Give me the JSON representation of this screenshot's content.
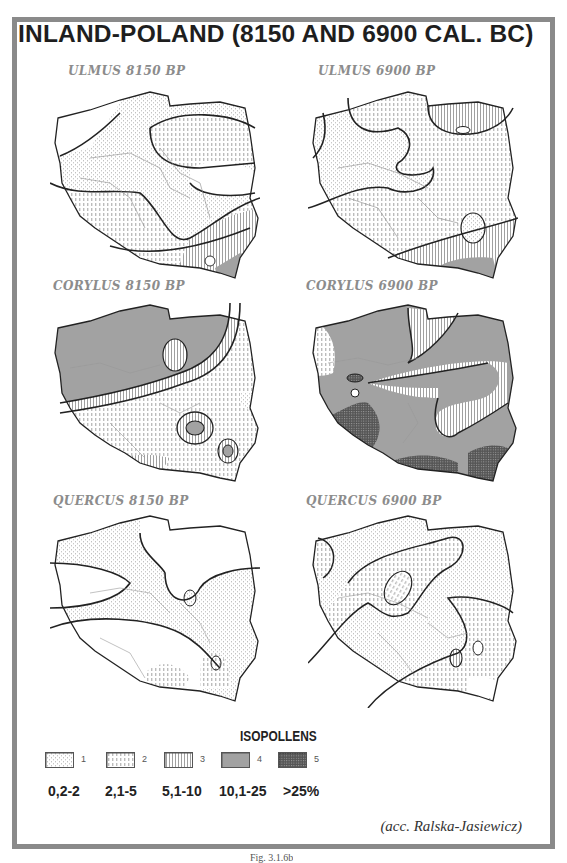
{
  "title": "INLAND-POLAND (8150 AND 6900 CAL. BC)",
  "maps": [
    {
      "label": "ULMUS 8150 BP",
      "taxon": "Ulmus",
      "age": "8150 BP"
    },
    {
      "label": "ULMUS 6900 BP",
      "taxon": "Ulmus",
      "age": "6900 BP"
    },
    {
      "label": "CORYLUS 8150 BP",
      "taxon": "Corylus",
      "age": "8150 BP"
    },
    {
      "label": "CORYLUS 6900 BP",
      "taxon": "Corylus",
      "age": "6900 BP"
    },
    {
      "label": "QUERCUS 8150 BP",
      "taxon": "Quercus",
      "age": "8150 BP"
    },
    {
      "label": "QUERCUS 6900 BP",
      "taxon": "Quercus",
      "age": "6900 BP"
    }
  ],
  "legend": {
    "title": "ISOPOLLENS",
    "items": [
      {
        "num": "1",
        "range": "0,2-2",
        "pattern": "dotted-vertical-sparse"
      },
      {
        "num": "2",
        "range": "2,1-5",
        "pattern": "dashed-vertical"
      },
      {
        "num": "3",
        "range": "5,1-10",
        "pattern": "vertical-lines"
      },
      {
        "num": "4",
        "range": "10,1-25",
        "pattern": "dense-vertical-lines"
      },
      {
        "num": "5",
        "range": ">25%",
        "pattern": "cross-hatch-dark"
      }
    ]
  },
  "credit": "(acc. Ralska-Jasiewicz)",
  "caption": "Fig. 3.1.6b",
  "colors": {
    "frame": "#8a8a8a",
    "label_grey": "#8c8c8c",
    "text": "#1e1e1e"
  }
}
